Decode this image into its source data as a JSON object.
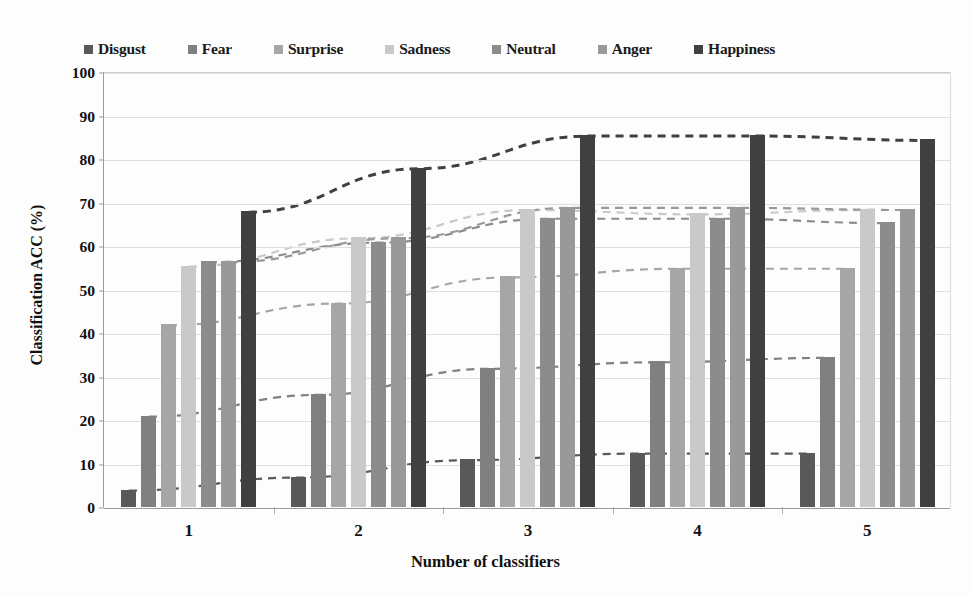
{
  "chart_data": {
    "type": "bar",
    "title": "",
    "xlabel": "Number of classifiers",
    "ylabel": "Classification ACC (%)",
    "categories": [
      "1",
      "2",
      "3",
      "4",
      "5"
    ],
    "ylim": [
      0,
      100
    ],
    "yticks": [
      "0",
      "10",
      "20",
      "30",
      "40",
      "50",
      "60",
      "70",
      "80",
      "90",
      "100"
    ],
    "grid": true,
    "legend_position": "top",
    "trendlines": "dashed connectors across groups per series",
    "series": [
      {
        "name": "Disgust",
        "color": "#595959",
        "values": [
          4,
          7,
          11,
          12.5,
          12.5
        ]
      },
      {
        "name": "Fear",
        "color": "#808080",
        "values": [
          21,
          26,
          32,
          33.5,
          34.5
        ]
      },
      {
        "name": "Surprise",
        "color": "#a6a6a6",
        "values": [
          42,
          47,
          53,
          55,
          55
        ]
      },
      {
        "name": "Sadness",
        "color": "#c9c9c9",
        "values": [
          55.5,
          62,
          68.5,
          67.5,
          68.5
        ]
      },
      {
        "name": "Neutral",
        "color": "#8c8c8c",
        "values": [
          56.5,
          61,
          66.5,
          66.5,
          65.5
        ]
      },
      {
        "name": "Anger",
        "color": "#999999",
        "values": [
          56.5,
          62,
          69,
          69,
          68.5
        ]
      },
      {
        "name": "Happiness",
        "color": "#404040",
        "values": [
          68,
          78,
          85.5,
          85.5,
          84.5
        ]
      }
    ]
  }
}
